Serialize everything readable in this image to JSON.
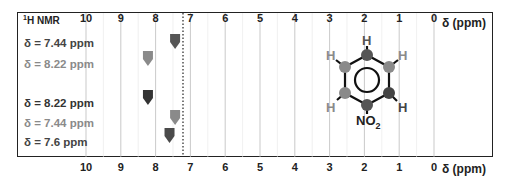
{
  "chart_data": {
    "type": "scatter",
    "title": "1H NMR",
    "xlabel": "δ (ppm)",
    "ylabel": "",
    "xlim": [
      10,
      0
    ],
    "x_ticks": [
      "10",
      "9",
      "8",
      "7",
      "6",
      "5",
      "4",
      "3",
      "2",
      "1",
      "0"
    ],
    "grid": true,
    "reference_line": {
      "x": 7.26,
      "style": "dotted"
    },
    "series": [
      {
        "name": "δ = 7.44 ppm",
        "x": 7.44,
        "row": 1,
        "color": "#555555"
      },
      {
        "name": "δ = 8.22 ppm",
        "x": 8.22,
        "row": 2,
        "color": "#8a8a8a"
      },
      {
        "name": "δ = 8.22  ppm",
        "x": 8.22,
        "row": 3,
        "color": "#333333"
      },
      {
        "name": "δ = 7.44 ppm",
        "x": 7.44,
        "row": 4,
        "color": "#8a8a8a"
      },
      {
        "name": "δ = 7.6 ppm",
        "x": 7.6,
        "row": 5,
        "color": "#4a4a4a"
      }
    ],
    "annotation": {
      "molecule": "nitrobenzene",
      "substituent": "NO2",
      "hydrogen_label": "H"
    }
  },
  "header": {
    "title_sup": "1",
    "title_rest": "H NMR"
  },
  "axis_unit": "δ (ppm)",
  "labels": [
    {
      "text": "δ = 7.44 ppm",
      "color": "#444444"
    },
    {
      "text": "δ = 8.22 ppm",
      "color": "#8a8a8a"
    },
    {
      "text": "δ = 8.22  ppm",
      "color": "#333333"
    },
    {
      "text": "δ = 7.44 ppm",
      "color": "#8a8a8a"
    },
    {
      "text": "δ = 7.6 ppm",
      "color": "#444444"
    }
  ],
  "molecule": {
    "h": "H",
    "no2_main": "NO",
    "no2_sub": "2"
  }
}
